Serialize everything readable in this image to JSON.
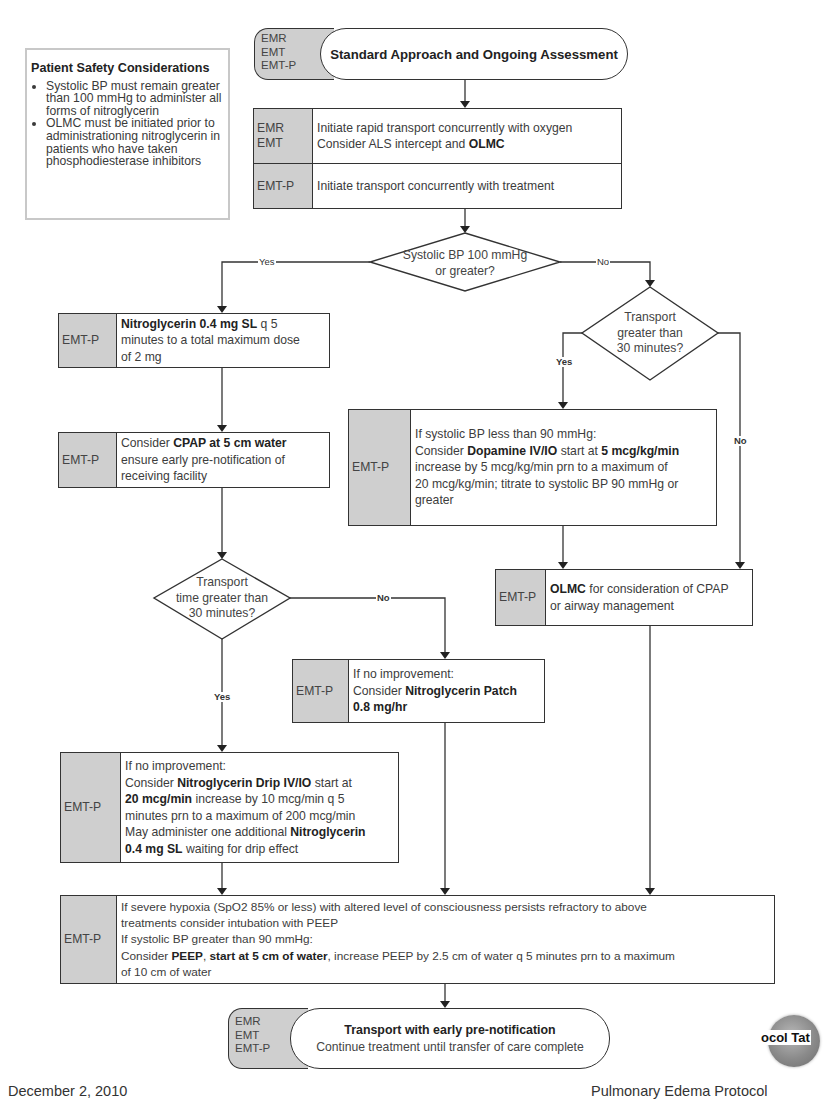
{
  "safety": {
    "title": "Patient Safety Considerations",
    "items": [
      "Systolic BP must remain greater than 100 mmHg to administer all forms of nitroglycerin",
      "OLMC must be initiated prior to administrationing nitroglycerin in patients who have taken phosphodiesterase inhibitors"
    ]
  },
  "start": {
    "roles": [
      "EMR",
      "EMT",
      "EMT-P"
    ],
    "title": "Standard Approach and Ongoing Assessment"
  },
  "initial_box": {
    "rows": [
      {
        "roles": "EMR\nEMT",
        "line1": "Initiate rapid transport concurrently with oxygen",
        "line2_prefix": "Consider ALS intercept and ",
        "line2_bold": "OLMC"
      },
      {
        "roles": "EMT-P",
        "line1": "Initiate transport concurrently with treatment"
      }
    ]
  },
  "decision_bp": {
    "line1": "Systolic BP 100 mmHg",
    "line2": "or greater?",
    "yes_label": "Yes",
    "no_label": "No"
  },
  "nitro_box": {
    "role": "EMT-P",
    "bold": "Nitroglycerin 0.4 mg SL",
    "rest1": " q 5",
    "line2": "minutes to a total maximum dose",
    "line3": "of 2 mg"
  },
  "cpap_box": {
    "role": "EMT-P",
    "prefix": "Consider ",
    "bold": "CPAP at 5 cm water",
    "line2": "ensure early pre-notification of",
    "line3": "receiving facility"
  },
  "decision_transport_right": {
    "line1": "Transport",
    "line2": "greater than",
    "line3": "30 minutes?",
    "yes_label": "Yes",
    "no_label": "No"
  },
  "dopamine_box": {
    "role": "EMT-P",
    "line1": "If systolic BP less than 90 mmHg:",
    "l2_prefix": "Consider ",
    "l2_bold1": "Dopamine IV/IO",
    "l2_mid": " start at ",
    "l2_bold2": "5 mcg/kg/min",
    "line3": "increase by 5 mcg/kg/min prn to a maximum of",
    "line4": "20 mcg/kg/min; titrate to systolic BP 90 mmHg or",
    "line5": "greater"
  },
  "olmc_box": {
    "role": "EMT-P",
    "bold": "OLMC",
    "rest": " for consideration of CPAP",
    "line2": "or airway management"
  },
  "decision_transport_left": {
    "line1": "Transport",
    "line2": "time greater than",
    "line3": "30 minutes?",
    "yes_label": "Yes",
    "no_label": "No"
  },
  "patch_box": {
    "role": "EMT-P",
    "line1": "If no improvement:",
    "l2_prefix": "Consider ",
    "l2_bold": "Nitroglycerin Patch",
    "line3_bold": "0.8 mg/hr"
  },
  "drip_box": {
    "role": "EMT-P",
    "line1": "If no improvement:",
    "l2_prefix": "Consider ",
    "l2_bold": "Nitroglycerin Drip IV/IO",
    "l2_rest": " start at",
    "l3_bold": "20 mcg/min",
    "l3_rest": " increase by 10 mcg/min q 5",
    "line4": "minutes prn to a maximum of 200 mcg/min",
    "l5_prefix": "May administer one additional ",
    "l5_bold": "Nitroglycerin",
    "l6_bold": "0.4 mg SL",
    "l6_rest": " waiting for drip effect"
  },
  "peep_box": {
    "role": "EMT-P",
    "line1": "If severe hypoxia (SpO2 85% or less) with altered level of consciousness persists refractory to above",
    "line2": "treatments consider intubation with PEEP",
    "line3": "If systolic BP greater than 90 mmHg:",
    "l4_prefix": "Consider ",
    "l4_bold1": "PEEP",
    "l4_sep": ", ",
    "l4_bold2": "start at 5 cm of water",
    "l4_rest": ", increase PEEP by 2.5 cm of water q 5 minutes prn to a maximum",
    "line5": "of 10 cm of water"
  },
  "end": {
    "roles": [
      "EMR",
      "EMT",
      "EMT-P"
    ],
    "title": "Transport with early pre-notification",
    "subtitle": "Continue treatment until transfer of care complete"
  },
  "footer": {
    "date": "December 2, 2010",
    "title": "Pulmonary Edema Protocol",
    "logo_text": "ocol Tat"
  }
}
